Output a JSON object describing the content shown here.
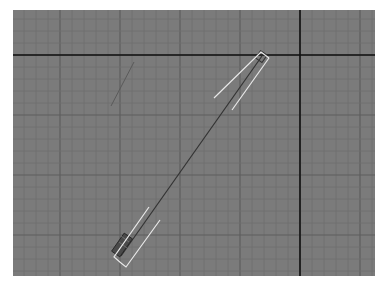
{
  "viewport": {
    "name": "orthographic-viewport",
    "label": "",
    "background": "#7b7b7b",
    "grid": {
      "minor_spacing": 12,
      "minor_color": "#6e6e6e",
      "major_every": 5,
      "major_color": "#5e5e5e"
    },
    "axes": {
      "horizontal_y": 45,
      "vertical_x": 287,
      "color": "#111111"
    },
    "objects": [
      {
        "name": "long-diagonal-object",
        "from": [
          249,
          46
        ],
        "to": [
          108,
          246
        ],
        "color": "#333333"
      },
      {
        "name": "short-diagonal-line",
        "from": [
          121,
          52
        ],
        "to": [
          98,
          96
        ],
        "color": "#5a5a5a"
      }
    ],
    "selection_brackets": {
      "color": "#e8e8e8"
    }
  }
}
